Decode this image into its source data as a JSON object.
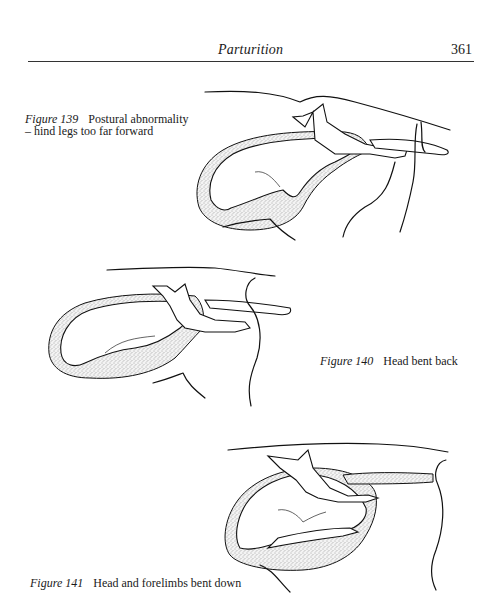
{
  "header": {
    "running_title": "Parturition",
    "page_number": "361"
  },
  "figures": [
    {
      "label": "Figure 139",
      "caption": "Postural abnormality – hind legs too far forward",
      "illustration": "calf-in-uterus-hind-legs-forward"
    },
    {
      "label": "Figure 140",
      "caption": "Head bent back",
      "illustration": "calf-in-uterus-head-bent-back"
    },
    {
      "label": "Figure 141",
      "caption": "Head and forelimbs bent down",
      "illustration": "calf-in-uterus-head-forelimbs-bent-down"
    }
  ]
}
